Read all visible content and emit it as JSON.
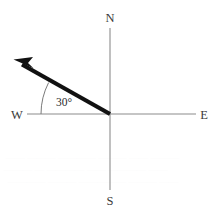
{
  "diagram": {
    "background_color": "#ffffff",
    "width": 223,
    "height": 212
  },
  "compass": {
    "north_label": "N",
    "south_label": "S",
    "east_label": "E",
    "west_label": "W",
    "axis_color": "#8c8c8c"
  },
  "vector": {
    "label": "direction-vector",
    "color": "#111111",
    "origin": {
      "x": 110,
      "y": 114
    },
    "tip": {
      "x": 14,
      "y": 60
    },
    "bearing_text": "N60°W"
  },
  "angle": {
    "value_label": "30°",
    "measured_from": "W",
    "arc_color": "#7a7a7a"
  },
  "artifacts": {
    "bleed_line_1": "—— ——— ———— ——— —— ———",
    "bleed_line_2": "——— — ———— —— ———— ——",
    "bleed_line_3": "———— ——— ————— ——— ——"
  }
}
